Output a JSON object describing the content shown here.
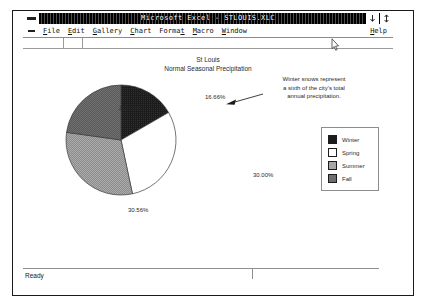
{
  "window": {
    "title": "Microsoft Excel - STLOUIS.XLC",
    "app_control_icon": "app-control-menu-icon",
    "doc_control_icon": "document-control-menu-icon",
    "minimize_glyph": "↓",
    "maximize_glyph": "↕"
  },
  "menu": {
    "items": [
      {
        "label": "File",
        "mnemonic": "F"
      },
      {
        "label": "Edit",
        "mnemonic": "E"
      },
      {
        "label": "Gallery",
        "mnemonic": "G"
      },
      {
        "label": "Chart",
        "mnemonic": "C"
      },
      {
        "label": "Format",
        "mnemonic": "t"
      },
      {
        "label": "Macro",
        "mnemonic": "M"
      },
      {
        "label": "Window",
        "mnemonic": "W"
      }
    ],
    "help": {
      "label": "Help",
      "mnemonic": "H"
    }
  },
  "chart": {
    "title_line1": "St Louis",
    "title_line2": "Normal Seasonal Precipitation",
    "annotation_lines": [
      "Winter snows represent",
      "a  sixth of the city's total",
      "annual precipitation."
    ]
  },
  "legend": {
    "items": [
      {
        "label": "Winter",
        "color": "#1a1a1a"
      },
      {
        "label": "Spring",
        "color": "#ffffff"
      },
      {
        "label": "Summer",
        "color": "#a2a2a2"
      },
      {
        "label": "Fall",
        "color": "#6e6e6e"
      }
    ]
  },
  "status": {
    "text": "Ready"
  },
  "chart_data": {
    "type": "pie",
    "title": "St Louis Normal Seasonal Precipitation",
    "categories": [
      "Winter",
      "Spring",
      "Summer",
      "Fall"
    ],
    "values": [
      16.66,
      30.0,
      30.56,
      22.77
    ],
    "labels": [
      "16.66%",
      "30.00%",
      "30.56%",
      "22.77%"
    ],
    "colors": [
      "#1a1a1a",
      "#ffffff",
      "#a2a2a2",
      "#6e6e6e"
    ],
    "units": "percent",
    "start_angle_deg": 0,
    "direction": "clockwise",
    "legend_position": "right",
    "grid": false,
    "annotation": "Winter snows represent a sixth of the city's total annual precipitation.",
    "xlabel": "",
    "ylabel": ""
  }
}
